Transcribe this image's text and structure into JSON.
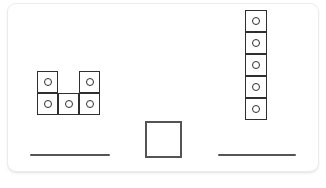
{
  "canvas": {
    "width": 326,
    "height": 188,
    "background_color": "#ffffff"
  },
  "card": {
    "background_color": "#ffffff",
    "border_color": "#ececed",
    "corner_radius": 9,
    "x": 7,
    "y": 3,
    "width": 312,
    "height": 169
  },
  "style": {
    "cell_stroke_color": "#2f2f2f",
    "dot_stroke_color": "#2f2f2f",
    "square_stroke_color": "#545454",
    "line_color": "#545454",
    "cell_fill": "#ffffff"
  },
  "shapes": [
    {
      "id": "left-shape",
      "name": "u-shape-piece",
      "description": "U-shaped piece of five dotted cells: two on the top row with a gap between them, three on the bottom row",
      "cell_count": 5,
      "cell_width": 21,
      "cell_height": 22,
      "origin_x": 37,
      "origin_y": 71,
      "grid": [
        [
          1,
          0,
          1
        ],
        [
          1,
          1,
          1
        ]
      ],
      "cells": [
        {
          "label": "top-left",
          "col": 0,
          "row": 0,
          "dot": true
        },
        {
          "label": "top-right",
          "col": 2,
          "row": 0,
          "dot": true
        },
        {
          "label": "bottom-left",
          "col": 0,
          "row": 1,
          "dot": true
        },
        {
          "label": "bottom-middle",
          "col": 1,
          "row": 1,
          "dot": true
        },
        {
          "label": "bottom-right",
          "col": 2,
          "row": 1,
          "dot": true
        }
      ]
    },
    {
      "id": "right-shape",
      "name": "vertical-column-piece",
      "description": "Vertical column of five dotted cells stacked top to bottom",
      "cell_count": 5,
      "cell_width": 22,
      "cell_height": 22,
      "origin_x": 245,
      "origin_y": 10,
      "grid": [
        [
          1
        ],
        [
          1
        ],
        [
          1
        ],
        [
          1
        ],
        [
          1
        ]
      ],
      "cells": [
        {
          "label": "cell-1",
          "col": 0,
          "row": 0,
          "dot": true
        },
        {
          "label": "cell-2",
          "col": 0,
          "row": 1,
          "dot": true
        },
        {
          "label": "cell-3",
          "col": 0,
          "row": 2,
          "dot": true
        },
        {
          "label": "cell-4",
          "col": 0,
          "row": 3,
          "dot": true
        },
        {
          "label": "cell-5",
          "col": 0,
          "row": 4,
          "dot": true
        }
      ]
    }
  ],
  "target_square": {
    "id": "center-square",
    "name": "empty-target-square",
    "description": "Empty square outline with no dot, centered near the bottom",
    "x": 145,
    "y": 121,
    "width": 37,
    "height": 37,
    "dot": false
  },
  "slot_lines": [
    {
      "id": "left-slot",
      "name": "left-answer-line",
      "x": 30,
      "y": 154,
      "width": 80
    },
    {
      "id": "right-slot",
      "name": "right-answer-line",
      "x": 218,
      "y": 154,
      "width": 78
    }
  ]
}
